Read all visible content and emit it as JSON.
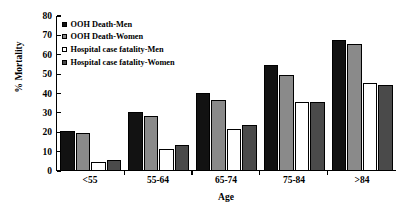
{
  "chart_data": {
    "type": "bar",
    "title": "",
    "xlabel": "Age",
    "ylabel": "% Mortality",
    "ylim": [
      0,
      80
    ],
    "yticks": [
      0,
      10,
      20,
      30,
      40,
      50,
      60,
      70,
      80
    ],
    "grid": false,
    "legend_position": "top-left",
    "categories": [
      "<55",
      "55-64",
      "65-74",
      "75-84",
      ">84"
    ],
    "series": [
      {
        "name": "OOH Death-Men",
        "color": "#121212",
        "values": [
          20,
          30,
          40,
          54,
          67
        ]
      },
      {
        "name": "OOH Death-Women",
        "color": "#8a8a8a",
        "values": [
          19,
          28,
          36,
          49,
          65
        ]
      },
      {
        "name": "Hospital case fatality-Men",
        "color": "#ffffff",
        "values": [
          4,
          11,
          21,
          35,
          45
        ]
      },
      {
        "name": "Hospital case fatality-Women",
        "color": "#4a4a4a",
        "values": [
          5,
          13,
          23,
          35,
          44
        ]
      }
    ]
  }
}
